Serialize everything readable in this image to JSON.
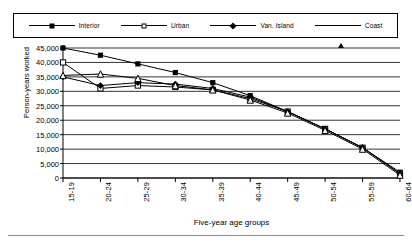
{
  "chart_data": {
    "type": "line",
    "title": "",
    "xlabel": "Five-year age groups",
    "ylabel": "Person-years worked",
    "categories": [
      "15-19",
      "20-24",
      "25-29",
      "30-34",
      "35-39",
      "40-44",
      "45-49",
      "50-54",
      "55-59",
      "60-64"
    ],
    "ylim": [
      0,
      45000
    ],
    "ytick_labels": [
      "45,000",
      "40,000",
      "35,000",
      "30,000",
      "25,000",
      "20,000",
      "15,000",
      "10,000",
      "5,000",
      "0"
    ],
    "ytick_values": [
      45000,
      40000,
      35000,
      30000,
      25000,
      20000,
      15000,
      10000,
      5000,
      0
    ],
    "grid": true,
    "legend_position": "top",
    "series": [
      {
        "name": "Interior",
        "marker": "filled-square",
        "values": [
          45000,
          42500,
          39500,
          36500,
          33000,
          28500,
          23000,
          17000,
          10500,
          2000
        ]
      },
      {
        "name": "Urban",
        "marker": "open-square",
        "values": [
          40000,
          31000,
          32000,
          31500,
          30500,
          27500,
          23000,
          17000,
          10500,
          1500
        ]
      },
      {
        "name": "Van. Island",
        "marker": "filled-diamond",
        "values": [
          35000,
          32000,
          33000,
          32500,
          31000,
          28000,
          23000,
          17000,
          10500,
          1500
        ]
      },
      {
        "name": "Coast",
        "marker": "open-triangle",
        "values": [
          35500,
          36000,
          34500,
          32000,
          30500,
          27000,
          22500,
          16500,
          10000,
          1000
        ]
      }
    ]
  },
  "legend": {
    "items": [
      {
        "label": "Interior"
      },
      {
        "label": "Urban"
      },
      {
        "label": "Van. Island"
      },
      {
        "label": "Coast"
      }
    ]
  }
}
